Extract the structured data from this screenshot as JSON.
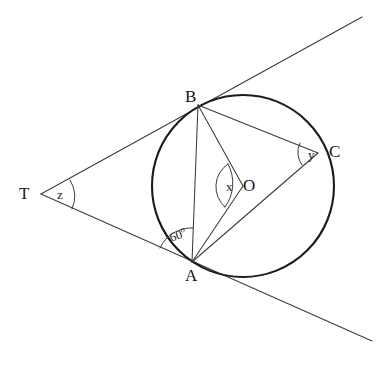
{
  "figure": {
    "type": "circle-geometry-diagram",
    "background_color": "#ffffff",
    "stroke_color": "#3a3a42",
    "circle_color": "#1b1b1f",
    "canvas": {
      "width": 387,
      "height": 371
    }
  },
  "circle": {
    "label": "circle-O",
    "center": {
      "x": 243,
      "y": 186
    },
    "radius": 91
  },
  "points": [
    {
      "key": "A",
      "label": "A",
      "x": 192,
      "y": 262,
      "label_x": 185,
      "label_y": 267,
      "on_circle": true
    },
    {
      "key": "B",
      "label": "B",
      "x": 198,
      "y": 105,
      "label_x": 185,
      "label_y": 88,
      "on_circle": true
    },
    {
      "key": "C",
      "label": "C",
      "x": 318,
      "y": 153,
      "label_x": 329,
      "label_y": 143,
      "on_circle": true
    },
    {
      "key": "O",
      "label": "O",
      "x": 243,
      "y": 186,
      "label_x": 243,
      "label_y": 177,
      "on_circle": false
    },
    {
      "key": "T",
      "label": "T",
      "x": 41,
      "y": 194,
      "label_x": 19,
      "label_y": 185,
      "on_circle": false
    }
  ],
  "segments": [
    {
      "key": "tangent-TB",
      "label": "tangent line through T and B",
      "from": "T",
      "to": "B",
      "extend_to": {
        "x": 362,
        "y": 17
      }
    },
    {
      "key": "tangent-TA",
      "label": "tangent line through T and A",
      "from": "T",
      "to": "A",
      "extend_to": {
        "x": 372,
        "y": 341
      }
    },
    {
      "key": "chord-AB",
      "label": "chord A to B",
      "from": "A",
      "to": "B"
    },
    {
      "key": "chord-BC",
      "label": "chord B to C",
      "from": "B",
      "to": "C"
    },
    {
      "key": "chord-AC",
      "label": "chord A to C",
      "from": "A",
      "to": "C"
    },
    {
      "key": "radius-OB",
      "label": "radius O to B",
      "from": "O",
      "to": "B"
    },
    {
      "key": "radius-OA",
      "label": "radius O to A",
      "from": "O",
      "to": "A"
    }
  ],
  "angles": [
    {
      "key": "angle-A",
      "label": "60",
      "degree_symbol": "o",
      "vertex": "A",
      "text_x": 170,
      "text_y": 232,
      "note": "angle between tangent TA and chord AB at A"
    },
    {
      "key": "angle-x",
      "label": "x",
      "vertex": "O",
      "text_x": 226,
      "text_y": 180,
      "note": "angle AOB at centre O"
    },
    {
      "key": "angle-y",
      "label": "y",
      "vertex": "C",
      "text_x": 308,
      "text_y": 148,
      "note": "angle BCA at circumference"
    },
    {
      "key": "angle-z",
      "label": "z",
      "vertex": "T",
      "text_x": 57,
      "text_y": 188,
      "note": "angle between the two tangents at T"
    }
  ]
}
